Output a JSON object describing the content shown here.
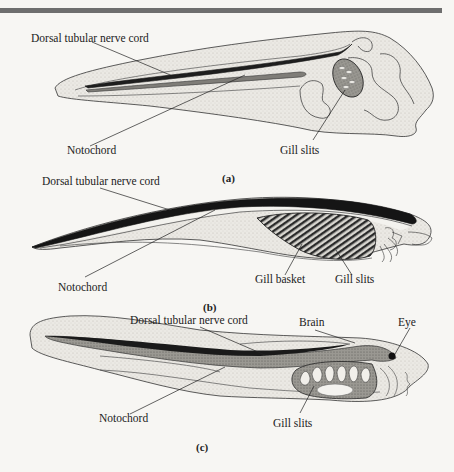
{
  "figure": {
    "panels": [
      {
        "id": "a",
        "caption": "(a)",
        "labels": {
          "nerve_cord": "Dorsal tubular nerve cord",
          "notochord": "Notochord",
          "gill_slits": "Gill slits"
        }
      },
      {
        "id": "b",
        "caption": "(b)",
        "labels": {
          "nerve_cord": "Dorsal tubular nerve cord",
          "notochord": "Notochord",
          "gill_basket": "Gill basket",
          "gill_slits": "Gill slits"
        }
      },
      {
        "id": "c",
        "caption": "(c)",
        "labels": {
          "nerve_cord": "Dorsal tubular nerve cord",
          "brain": "Brain",
          "eye": "Eye",
          "notochord": "Notochord",
          "gill_slits": "Gill slits"
        }
      }
    ]
  },
  "colors": {
    "background": "#f7f6f3",
    "ink": "#222222",
    "stipple": "#dcdad5",
    "dark_fill": "#1c1c1c",
    "mid_fill": "#8a8a8a",
    "top_rule": "#6e6e6e"
  }
}
